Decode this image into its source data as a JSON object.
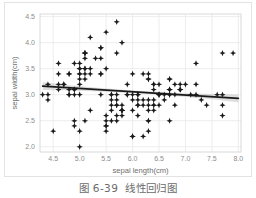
{
  "caption": {
    "number": "图 6-39",
    "title": "线性回归图",
    "full": "图 6-39  线性回归图"
  },
  "colors": {
    "point": "#1a1a1a",
    "regression_line": "#1a1a1a",
    "confidence_band": "#b5b5b5",
    "gridline": "#e8e8e8",
    "axis_frame": "#d6d6d6",
    "tick_label": "#8c8c8c",
    "axis_title": "#6e6e6e",
    "caption_text": "#6b6b6b",
    "card_border": "#e3e3e3",
    "background": "#ffffff"
  },
  "chart_data": {
    "type": "scatter",
    "title": "",
    "xlabel": "sepal length(cm)",
    "ylabel": "sepal width(cm)",
    "xlim": [
      4.25,
      8.05
    ],
    "ylim": [
      1.9,
      4.55
    ],
    "xticks": [
      "4.5",
      "5.0",
      "5.5",
      "6.0",
      "6.5",
      "7.0",
      "7.5",
      "8.0"
    ],
    "xtick_values": [
      4.5,
      5.0,
      5.5,
      6.0,
      6.5,
      7.0,
      7.5,
      8.0
    ],
    "yticks": [
      "2.0",
      "2.5",
      "3.0",
      "3.5",
      "4.0",
      "4.5"
    ],
    "ytick_values": [
      2.0,
      2.5,
      3.0,
      3.5,
      4.0,
      4.5
    ],
    "grid": true,
    "legend": false,
    "marker": "star",
    "marker_size": 3.1,
    "regression": {
      "type": "linear",
      "x_start": 4.3,
      "y_start": 3.165,
      "x_end": 8.0,
      "y_end": 2.93,
      "slope": -0.0635,
      "intercept": 3.438,
      "band_half_width_start": 0.075,
      "band_half_width_mid": 0.025,
      "band_half_width_end": 0.075
    },
    "x": [
      5.1,
      4.9,
      4.7,
      4.6,
      5.0,
      5.4,
      4.6,
      5.0,
      4.4,
      4.9,
      5.4,
      4.8,
      4.8,
      4.3,
      5.8,
      5.7,
      5.4,
      5.1,
      5.7,
      5.1,
      5.4,
      5.1,
      4.6,
      5.1,
      4.8,
      5.0,
      5.0,
      5.2,
      5.2,
      4.7,
      4.8,
      5.4,
      5.2,
      5.5,
      4.9,
      5.0,
      5.5,
      4.9,
      4.4,
      5.1,
      5.0,
      4.5,
      4.4,
      5.0,
      5.1,
      4.8,
      5.1,
      4.6,
      5.3,
      5.0,
      7.0,
      6.4,
      6.9,
      5.5,
      6.5,
      5.7,
      6.3,
      4.9,
      6.6,
      5.2,
      5.0,
      5.9,
      6.0,
      6.1,
      5.6,
      6.7,
      5.6,
      5.8,
      6.2,
      5.6,
      5.9,
      6.1,
      6.3,
      6.1,
      6.4,
      6.6,
      6.8,
      6.7,
      6.0,
      5.7,
      5.5,
      5.5,
      5.8,
      6.0,
      5.4,
      6.0,
      6.7,
      6.3,
      5.6,
      5.5,
      5.5,
      6.1,
      5.8,
      5.0,
      5.6,
      5.7,
      5.7,
      6.2,
      5.1,
      5.7,
      6.3,
      5.8,
      7.1,
      6.3,
      6.5,
      7.6,
      4.9,
      7.3,
      6.7,
      7.2,
      6.5,
      6.4,
      6.8,
      5.7,
      5.8,
      6.4,
      6.5,
      7.7,
      7.7,
      6.0,
      6.9,
      5.6,
      7.7,
      6.3,
      6.7,
      7.2,
      6.2,
      6.1,
      6.4,
      7.2,
      7.4,
      7.9,
      6.4,
      6.3,
      6.1,
      7.7,
      6.3,
      6.4,
      6.0,
      6.9,
      6.7,
      6.9,
      5.8,
      6.8,
      6.7,
      6.7,
      6.3,
      6.5,
      6.2,
      5.9
    ],
    "y": [
      3.5,
      3.0,
      3.2,
      3.1,
      3.6,
      3.9,
      3.4,
      3.4,
      2.9,
      3.1,
      3.7,
      3.4,
      3.0,
      3.0,
      4.0,
      4.4,
      3.9,
      3.5,
      3.8,
      3.8,
      3.4,
      3.7,
      3.6,
      3.3,
      3.4,
      3.0,
      3.4,
      3.5,
      3.4,
      3.2,
      3.1,
      3.4,
      4.1,
      4.2,
      3.1,
      3.2,
      3.5,
      3.6,
      3.0,
      3.4,
      3.5,
      2.3,
      3.2,
      3.5,
      3.8,
      3.0,
      3.8,
      3.2,
      3.7,
      3.3,
      3.2,
      3.2,
      3.1,
      2.3,
      2.8,
      2.8,
      3.3,
      2.4,
      2.9,
      2.7,
      2.0,
      3.0,
      2.2,
      2.9,
      2.9,
      3.1,
      3.0,
      2.7,
      2.2,
      2.5,
      3.2,
      2.8,
      2.5,
      2.8,
      2.9,
      3.0,
      2.8,
      3.0,
      2.9,
      2.6,
      2.4,
      2.4,
      2.7,
      2.7,
      3.0,
      3.4,
      3.1,
      2.3,
      3.0,
      2.5,
      2.6,
      3.0,
      2.6,
      2.3,
      2.7,
      3.0,
      2.9,
      2.9,
      2.5,
      2.8,
      3.3,
      2.7,
      3.0,
      2.9,
      3.0,
      3.0,
      2.5,
      2.9,
      2.5,
      3.6,
      3.2,
      2.7,
      3.0,
      2.5,
      2.8,
      3.2,
      3.0,
      3.8,
      2.6,
      2.2,
      3.2,
      2.8,
      2.8,
      2.7,
      3.3,
      3.2,
      2.8,
      3.0,
      2.8,
      3.0,
      2.8,
      3.8,
      2.8,
      2.8,
      2.6,
      3.0,
      3.4,
      3.1,
      3.0,
      3.1,
      3.1,
      3.1,
      2.7,
      3.2,
      3.3,
      3.0,
      2.5,
      3.0,
      3.4,
      3.0
    ]
  }
}
